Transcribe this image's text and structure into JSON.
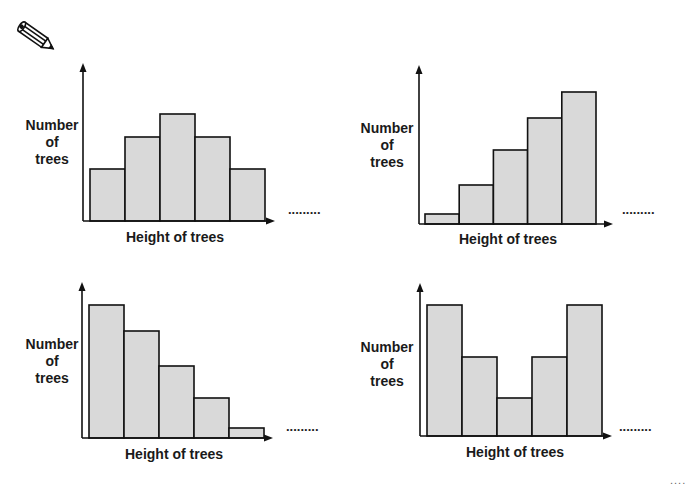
{
  "page": {
    "icon": "pencil-icon",
    "continuation": "....",
    "colors": {
      "bar_fill": "#d9d9d9",
      "stroke": "#111111",
      "background": "#ffffff"
    }
  },
  "chart_data": [
    {
      "type": "bar",
      "title": "",
      "shape": "symmetric (bell-shaped)",
      "xlabel": "Height of trees",
      "ylabel": "Number\nof\ntrees",
      "ylabel_lines": [
        "Number",
        "of",
        "trees"
      ],
      "categories": [
        "1",
        "2",
        "3",
        "4",
        "5"
      ],
      "values": [
        52,
        84,
        107,
        84,
        52
      ],
      "continuation": ".........",
      "grid": false,
      "legend": null
    },
    {
      "type": "bar",
      "title": "",
      "shape": "skewed left (increasing)",
      "xlabel": "Height of trees",
      "ylabel": "Number\nof\ntrees",
      "ylabel_lines": [
        "Number",
        "of",
        "trees"
      ],
      "categories": [
        "1",
        "2",
        "3",
        "4",
        "5"
      ],
      "values": [
        10,
        39,
        74,
        106,
        132
      ],
      "continuation": ".........",
      "grid": false,
      "legend": null
    },
    {
      "type": "bar",
      "title": "",
      "shape": "skewed right (decreasing)",
      "xlabel": "Height of trees",
      "ylabel": "Number\nof\ntrees",
      "ylabel_lines": [
        "Number",
        "of",
        "trees"
      ],
      "categories": [
        "1",
        "2",
        "3",
        "4",
        "5"
      ],
      "values": [
        133,
        107,
        72,
        40,
        10
      ],
      "continuation": ".........",
      "grid": false,
      "legend": null
    },
    {
      "type": "bar",
      "title": "",
      "shape": "bimodal (U-shaped)",
      "xlabel": "Height of trees",
      "ylabel": "Number\nof\ntrees",
      "ylabel_lines": [
        "Number",
        "of",
        "trees"
      ],
      "categories": [
        "1",
        "2",
        "3",
        "4",
        "5"
      ],
      "values": [
        131,
        79,
        38,
        79,
        131
      ],
      "continuation": ".........",
      "grid": false,
      "legend": null
    }
  ]
}
